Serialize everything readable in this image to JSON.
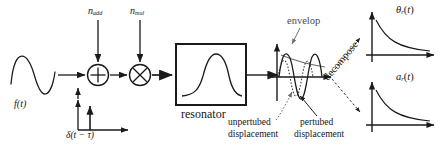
{
  "diagram": {
    "type": "block-diagram",
    "background_color": "#ffffff",
    "stroke_color": "#1a1a1a",
    "faint_stroke_color": "#707070"
  },
  "input": {
    "signal_label_base": "f",
    "signal_label": "f(t)",
    "waveform": "sine-one-cycle"
  },
  "noise": {
    "additive": {
      "base": "n",
      "sub": "add",
      "label": "nadd"
    },
    "multiplicative": {
      "base": "n",
      "sub": "mul",
      "label": "nmul"
    }
  },
  "operators": {
    "sum_glyph": "+",
    "product_glyph": "×"
  },
  "impulse": {
    "label": "δ(t − τ)",
    "description": "delta impulse train on small axes"
  },
  "resonator": {
    "label": "resonator",
    "response_curve": "bandpass-bell"
  },
  "response_plot": {
    "envelope_label": "envelop",
    "unperturbed_label_line1": "unpertubed",
    "unperturbed_label_line2": "displacement",
    "perturbed_label_line1": "pertubed",
    "perturbed_label_line2": "displacement",
    "decompose_label": "decompose"
  },
  "outputs": [
    {
      "name": "phase-output",
      "base": "θ",
      "sub": "r",
      "label": "θr(t)",
      "curve": "decaying-exponential"
    },
    {
      "name": "amplitude-output",
      "base": "a",
      "sub": "r",
      "label": "ar(t)",
      "curve": "decaying-exponential"
    }
  ]
}
